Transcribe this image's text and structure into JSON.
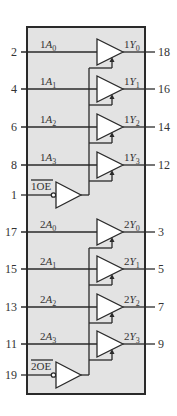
{
  "diagram": {
    "colors": {
      "body_fill": "#e3e3e3",
      "line": "#2a2a2a",
      "text": "#333333",
      "background": "#ffffff"
    },
    "chip": {
      "x": 27,
      "y": 27,
      "width": 118,
      "height": 367
    },
    "groups": [
      {
        "id": "group1",
        "buffers": [
          {
            "input_pin": "2",
            "input_label_prefix": "1",
            "input_label": "A",
            "input_sub": "0",
            "output_label_prefix": "1",
            "output_label": "Y",
            "output_sub": "0",
            "output_pin": "18",
            "y": 52
          },
          {
            "input_pin": "4",
            "input_label_prefix": "1",
            "input_label": "A",
            "input_sub": "1",
            "output_label_prefix": "1",
            "output_label": "Y",
            "output_sub": "1",
            "output_pin": "16",
            "y": 89
          },
          {
            "input_pin": "6",
            "input_label_prefix": "1",
            "input_label": "A",
            "input_sub": "2",
            "output_label_prefix": "1",
            "output_label": "Y",
            "output_sub": "2",
            "output_pin": "14",
            "y": 127
          },
          {
            "input_pin": "8",
            "input_label_prefix": "1",
            "input_label": "A",
            "input_sub": "3",
            "output_label_prefix": "1",
            "output_label": "Y",
            "output_sub": "3",
            "output_pin": "12",
            "y": 165
          }
        ],
        "enable": {
          "pin": "1",
          "label_prefix": "1",
          "label": "OE",
          "active_low": true,
          "y": 195
        }
      },
      {
        "id": "group2",
        "buffers": [
          {
            "input_pin": "17",
            "input_label_prefix": "2",
            "input_label": "A",
            "input_sub": "0",
            "output_label_prefix": "2",
            "output_label": "Y",
            "output_sub": "0",
            "output_pin": "3",
            "y": 232
          },
          {
            "input_pin": "15",
            "input_label_prefix": "2",
            "input_label": "A",
            "input_sub": "1",
            "output_label_prefix": "2",
            "output_label": "Y",
            "output_sub": "1",
            "output_pin": "5",
            "y": 269
          },
          {
            "input_pin": "13",
            "input_label_prefix": "2",
            "input_label": "A",
            "input_sub": "2",
            "output_label_prefix": "2",
            "output_label": "Y",
            "output_sub": "2",
            "output_pin": "7",
            "y": 307
          },
          {
            "input_pin": "11",
            "input_label_prefix": "2",
            "input_label": "A",
            "input_sub": "3",
            "output_label_prefix": "2",
            "output_label": "Y",
            "output_sub": "3",
            "output_pin": "9",
            "y": 344
          }
        ],
        "enable": {
          "pin": "19",
          "label_prefix": "2",
          "label": "OE",
          "active_low": true,
          "y": 375
        }
      }
    ]
  }
}
